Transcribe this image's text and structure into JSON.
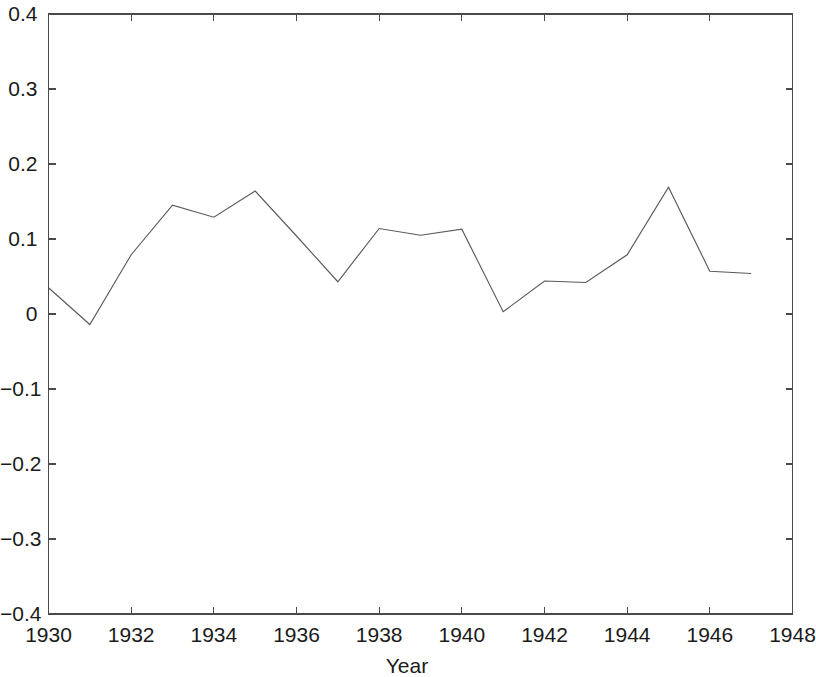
{
  "chart_data": {
    "type": "line",
    "title": "",
    "xlabel": "Year",
    "ylabel": "",
    "xlim": [
      1930,
      1948
    ],
    "ylim": [
      -0.4,
      0.4
    ],
    "grid": false,
    "legend": null,
    "xticks": [
      1930,
      1932,
      1934,
      1936,
      1938,
      1940,
      1942,
      1944,
      1946,
      1948
    ],
    "xtick_labels": [
      "1930",
      "1932",
      "1934",
      "1936",
      "1938",
      "1940",
      "1942",
      "1944",
      "1946",
      "1948"
    ],
    "yticks": [
      0.4,
      0.3,
      0.2,
      0.1,
      0,
      -0.1,
      -0.2,
      -0.3,
      -0.4
    ],
    "ytick_labels": [
      "0.4",
      "0.3",
      "0.2",
      "0.1",
      "0",
      "−0.1",
      "−0.2",
      "−0.3",
      "−0.4"
    ],
    "line_color": "#5a5a5a",
    "axis_color": "#4a4a4a",
    "series": [
      {
        "name": "series-1",
        "x": [
          1930,
          1931,
          1932,
          1933,
          1934,
          1935,
          1936,
          1937,
          1938,
          1939,
          1940,
          1941,
          1942,
          1943,
          1944,
          1945,
          1946,
          1947
        ],
        "values": [
          0.035,
          -0.014,
          0.079,
          0.145,
          0.129,
          0.164,
          0.104,
          0.043,
          0.114,
          0.105,
          0.113,
          0.003,
          0.044,
          0.042,
          0.079,
          0.169,
          0.057,
          0.054
        ]
      }
    ]
  },
  "axes": {
    "xlabel_text": "Year"
  }
}
